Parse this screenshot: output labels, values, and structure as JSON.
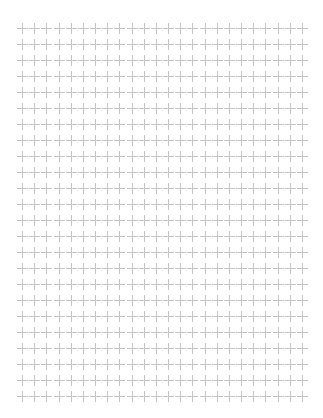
{
  "page": {
    "background": "#ffffff",
    "pattern": "cross-dot-grid"
  },
  "grid": {
    "rows": 24,
    "columns": 24,
    "first_center_x": 22,
    "first_center_y": 28,
    "spacing_x": 12.17,
    "spacing_y": 16,
    "mark_icon": "plus-icon",
    "mark_size": 11,
    "mark_color": "#c4c4c4"
  }
}
